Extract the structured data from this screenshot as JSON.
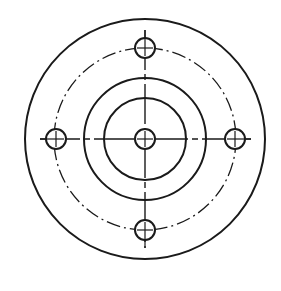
{
  "drawing": {
    "type": "flange-plate-top-view",
    "center": [
      145,
      139
    ],
    "stroke_color": "#1a1a1a",
    "background": "#ffffff",
    "outer_circle_radius": 120,
    "hub_outer_radius": 61,
    "hub_inner_radius": 41,
    "bolt_circle_radius": 91,
    "center_hole_radius": 10,
    "bolt_hole_radius": 10,
    "bolt_holes": [
      {
        "name": "top",
        "cx": 145,
        "cy": 48
      },
      {
        "name": "left",
        "cx": 56,
        "cy": 139
      },
      {
        "name": "right",
        "cx": 235,
        "cy": 139
      },
      {
        "name": "bottom",
        "cx": 145,
        "cy": 230
      }
    ],
    "centerlines": {
      "horizontal": {
        "x1": 40,
        "x2": 251,
        "y": 139
      },
      "vertical": {
        "x": 145,
        "y1": 30,
        "y2": 248
      }
    }
  }
}
